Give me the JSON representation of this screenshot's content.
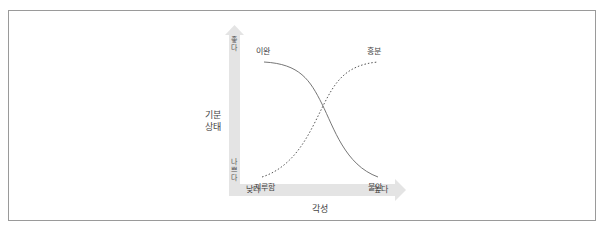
{
  "diagram": {
    "y_axis": {
      "title_line1": "기분",
      "title_line2": "상태",
      "top_label": "좋다",
      "bottom_label": "나쁘다"
    },
    "x_axis": {
      "title": "각성",
      "left_label": "낮다",
      "right_label": "높다"
    },
    "curves": [
      {
        "name": "solid",
        "style": "solid",
        "start_label": "이완",
        "end_label": "불안",
        "description": "high mood at low arousal falling to low mood at high arousal"
      },
      {
        "name": "dotted",
        "style": "dotted",
        "start_label": "지루함",
        "end_label": "흥분",
        "description": "low mood at low arousal rising to high mood at high arousal"
      }
    ],
    "colors": {
      "axis_bar": "#e4e4e4",
      "curve": "#555555",
      "frame": "#9a9a9a"
    }
  }
}
